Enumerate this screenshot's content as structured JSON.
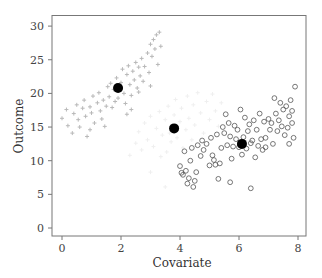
{
  "chart_data": {
    "type": "scatter",
    "title": "",
    "xlabel": "Covariate",
    "ylabel": "Outcome",
    "xlim": [
      -0.35,
      8.3
    ],
    "ylim": [
      -1.2,
      31.3
    ],
    "xticks": [
      0,
      2,
      4,
      6,
      8
    ],
    "yticks": [
      0,
      5,
      10,
      15,
      20,
      25,
      30
    ],
    "grid": false,
    "legend": null,
    "series": [
      {
        "name": "group-1-plus",
        "marker": "plus",
        "color": "#b8b8b8",
        "points": [
          [
            0.0,
            16.3
          ],
          [
            0.15,
            17.6
          ],
          [
            0.2,
            15.2
          ],
          [
            0.35,
            14.1
          ],
          [
            0.4,
            17.0
          ],
          [
            0.5,
            18.3
          ],
          [
            0.55,
            16.1
          ],
          [
            0.6,
            15.0
          ],
          [
            0.7,
            17.8
          ],
          [
            0.75,
            19.0
          ],
          [
            0.8,
            16.6
          ],
          [
            0.85,
            13.6
          ],
          [
            0.95,
            18.0
          ],
          [
            1.0,
            17.1
          ],
          [
            1.05,
            19.6
          ],
          [
            1.1,
            15.6
          ],
          [
            1.2,
            18.6
          ],
          [
            1.25,
            20.1
          ],
          [
            1.3,
            17.4
          ],
          [
            1.35,
            16.2
          ],
          [
            1.4,
            19.0
          ],
          [
            1.5,
            18.1
          ],
          [
            1.55,
            21.0
          ],
          [
            1.6,
            19.5
          ],
          [
            1.7,
            17.9
          ],
          [
            1.75,
            20.6
          ],
          [
            1.8,
            18.8
          ],
          [
            1.85,
            22.3
          ],
          [
            1.9,
            19.3
          ],
          [
            2.0,
            21.6
          ],
          [
            2.05,
            23.6
          ],
          [
            2.1,
            20.0
          ],
          [
            2.15,
            18.5
          ],
          [
            2.2,
            22.8
          ],
          [
            2.25,
            24.1
          ],
          [
            2.3,
            21.3
          ],
          [
            2.35,
            19.7
          ],
          [
            2.4,
            23.3
          ],
          [
            2.45,
            22.0
          ],
          [
            2.5,
            24.6
          ],
          [
            2.55,
            20.8
          ],
          [
            2.6,
            23.9
          ],
          [
            2.65,
            22.6
          ],
          [
            2.7,
            25.2
          ],
          [
            2.75,
            21.8
          ],
          [
            2.8,
            24.0
          ],
          [
            2.9,
            26.0
          ],
          [
            2.95,
            23.1
          ],
          [
            3.0,
            27.3
          ],
          [
            3.05,
            25.5
          ],
          [
            3.1,
            28.0
          ],
          [
            3.15,
            26.6
          ],
          [
            3.2,
            28.7
          ],
          [
            3.25,
            24.3
          ],
          [
            3.3,
            29.1
          ],
          [
            3.35,
            27.0
          ],
          [
            1.45,
            15.1
          ],
          [
            0.95,
            14.6
          ],
          [
            2.35,
            17.6
          ],
          [
            3.0,
            21.1
          ],
          [
            2.6,
            20.2
          ],
          [
            1.65,
            21.5
          ],
          [
            2.2,
            16.9
          ]
        ]
      },
      {
        "name": "group-2-faint",
        "marker": "plus",
        "color": "#efefef",
        "points": [
          [
            2.3,
            10.8
          ],
          [
            2.5,
            12.6
          ],
          [
            2.6,
            14.3
          ],
          [
            2.7,
            11.6
          ],
          [
            2.8,
            15.6
          ],
          [
            2.9,
            13.1
          ],
          [
            3.0,
            16.6
          ],
          [
            3.1,
            12.1
          ],
          [
            3.2,
            14.8
          ],
          [
            3.3,
            17.3
          ],
          [
            3.35,
            10.6
          ],
          [
            3.4,
            13.8
          ],
          [
            3.5,
            16.1
          ],
          [
            3.55,
            11.3
          ],
          [
            3.6,
            18.1
          ],
          [
            3.65,
            14.1
          ],
          [
            3.7,
            12.8
          ],
          [
            3.8,
            16.8
          ],
          [
            3.85,
            19.1
          ],
          [
            3.9,
            13.4
          ],
          [
            4.0,
            15.8
          ],
          [
            4.05,
            17.8
          ],
          [
            4.1,
            11.9
          ],
          [
            4.2,
            14.6
          ],
          [
            4.25,
            19.6
          ],
          [
            4.3,
            16.3
          ],
          [
            4.4,
            13.1
          ],
          [
            4.45,
            18.3
          ],
          [
            4.5,
            15.3
          ],
          [
            4.6,
            20.1
          ],
          [
            4.7,
            17.1
          ],
          [
            4.8,
            14.1
          ],
          [
            4.9,
            18.8
          ],
          [
            5.0,
            16.1
          ],
          [
            5.1,
            19.9
          ],
          [
            5.2,
            17.4
          ],
          [
            5.3,
            15.1
          ],
          [
            5.4,
            18.6
          ],
          [
            3.0,
            8.3
          ],
          [
            3.5,
            6.1
          ]
        ]
      },
      {
        "name": "group-3-circle",
        "marker": "open-circle",
        "color": "#555555",
        "points": [
          [
            4.0,
            9.2
          ],
          [
            4.1,
            7.9
          ],
          [
            4.15,
            11.4
          ],
          [
            4.2,
            8.5
          ],
          [
            4.25,
            6.6
          ],
          [
            4.3,
            7.4
          ],
          [
            4.35,
            10.0
          ],
          [
            4.4,
            11.9
          ],
          [
            4.45,
            6.1
          ],
          [
            4.5,
            7.0
          ],
          [
            4.6,
            12.3
          ],
          [
            4.7,
            10.7
          ],
          [
            4.75,
            13.0
          ],
          [
            4.8,
            11.6
          ],
          [
            4.9,
            12.5
          ],
          [
            5.0,
            9.3
          ],
          [
            5.05,
            13.4
          ],
          [
            5.1,
            10.8
          ],
          [
            5.2,
            9.4
          ],
          [
            5.25,
            13.9
          ],
          [
            5.3,
            7.3
          ],
          [
            5.35,
            9.6
          ],
          [
            5.4,
            11.9
          ],
          [
            5.45,
            15.0
          ],
          [
            5.5,
            14.1
          ],
          [
            5.55,
            16.9
          ],
          [
            5.6,
            12.3
          ],
          [
            5.65,
            15.6
          ],
          [
            5.7,
            13.6
          ],
          [
            5.75,
            10.3
          ],
          [
            5.8,
            12.1
          ],
          [
            5.85,
            15.2
          ],
          [
            5.9,
            13.2
          ],
          [
            5.95,
            14.6
          ],
          [
            6.0,
            12.0
          ],
          [
            6.05,
            17.6
          ],
          [
            6.1,
            10.9
          ],
          [
            6.15,
            13.5
          ],
          [
            6.2,
            16.4
          ],
          [
            6.25,
            11.8
          ],
          [
            6.3,
            14.4
          ],
          [
            6.35,
            15.4
          ],
          [
            6.4,
            12.6
          ],
          [
            6.45,
            13.0
          ],
          [
            6.5,
            16.0
          ],
          [
            6.55,
            10.5
          ],
          [
            6.6,
            14.6
          ],
          [
            6.65,
            12.2
          ],
          [
            6.7,
            17.0
          ],
          [
            6.75,
            13.2
          ],
          [
            6.8,
            11.6
          ],
          [
            6.85,
            15.8
          ],
          [
            6.9,
            12.0
          ],
          [
            7.0,
            16.2
          ],
          [
            7.05,
            14.6
          ],
          [
            7.1,
            15.6
          ],
          [
            7.15,
            12.5
          ],
          [
            7.2,
            19.3
          ],
          [
            7.25,
            17.0
          ],
          [
            7.3,
            14.4
          ],
          [
            7.35,
            16.0
          ],
          [
            7.4,
            18.6
          ],
          [
            7.45,
            15.1
          ],
          [
            7.5,
            17.6
          ],
          [
            7.55,
            13.8
          ],
          [
            7.6,
            18.1
          ],
          [
            7.65,
            14.9
          ],
          [
            7.7,
            16.6
          ],
          [
            7.75,
            19.0
          ],
          [
            7.8,
            15.6
          ],
          [
            7.85,
            13.4
          ],
          [
            7.9,
            21.0
          ],
          [
            5.7,
            6.8
          ],
          [
            6.4,
            5.9
          ],
          [
            4.05,
            8.2
          ],
          [
            4.55,
            8.3
          ],
          [
            5.15,
            10.1
          ],
          [
            6.9,
            13.4
          ],
          [
            7.7,
            12.5
          ],
          [
            7.8,
            17.4
          ]
        ]
      },
      {
        "name": "group-means",
        "marker": "filled-circle",
        "color": "#000000",
        "points": [
          [
            1.9,
            20.8
          ],
          [
            3.8,
            14.8
          ],
          [
            6.1,
            12.5
          ]
        ]
      }
    ]
  },
  "axes": {
    "xlabel": "Covariate",
    "ylabel": "Outcome",
    "xtick_labels": [
      "0",
      "2",
      "4",
      "6",
      "8"
    ],
    "ytick_labels": [
      "0",
      "5",
      "10",
      "15",
      "20",
      "25",
      "30"
    ]
  }
}
